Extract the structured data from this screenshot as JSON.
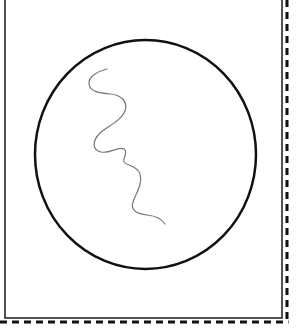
{
  "diagram": {
    "type": "microscope-field-of-view",
    "background": "#ffffff",
    "frame": {
      "inner_border": {
        "x": 5,
        "y": -2,
        "width": 277,
        "height": 320,
        "stroke": "#1a1a1a",
        "stroke_width": 1.5
      },
      "dashed_border": {
        "right_x": 287,
        "bottom_y": 322,
        "stroke": "#111111",
        "stroke_width": 3,
        "dash": "7,5"
      }
    },
    "field_circle": {
      "cx": 145.5,
      "cy": 154.5,
      "rx": 110.5,
      "ry": 114.5,
      "stroke": "#111111",
      "stroke_width": 2.5
    },
    "specimen": {
      "name": "spiral-filament",
      "stroke": "#777777",
      "stroke_width": 1.2,
      "path": "M107,69 C99,71 88,76 89,84 C90,92 100,93 110,94 C122,95 128,102 125,111 C121,121 108,126 100,133 C92,141 92,150 101,152 C110,154 118,146 124,149 C129,152 122,159 124,162 C127,166 137,165 140,174 C143,184 136,193 133,202 C130,211 138,214 147,215 C156,216 162,219 165,224"
    }
  }
}
